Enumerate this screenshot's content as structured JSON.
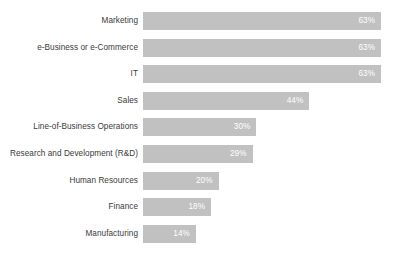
{
  "chart_data": {
    "type": "bar",
    "orientation": "horizontal",
    "title": "",
    "subtitle": "",
    "xlabel": "",
    "ylabel": "",
    "grid": false,
    "legend": false,
    "axis_visible": false,
    "xlim": [
      0,
      67.5
    ],
    "value_suffix": "%",
    "bar_color": "#c1c1c1",
    "value_label_color": "#ffffff",
    "category_label_color": "#3a3a3a",
    "background_color": "#ffffff",
    "categories": [
      "Marketing",
      "e-Business or e-Commerce",
      "IT",
      "Sales",
      "Line-of-Business Operations",
      "Research and Development (R&D)",
      "Human Resources",
      "Finance",
      "Manufacturing"
    ],
    "values": [
      63,
      63,
      63,
      44,
      30,
      29,
      20,
      18,
      14
    ],
    "value_labels": [
      "63%",
      "63%",
      "63%",
      "44%",
      "30%",
      "29%",
      "20%",
      "18%",
      "14%"
    ],
    "bars": [
      {
        "category": "Marketing",
        "value": 63,
        "value_label": "63%"
      },
      {
        "category": "e-Business or e-Commerce",
        "value": 63,
        "value_label": "63%"
      },
      {
        "category": "IT",
        "value": 63,
        "value_label": "63%"
      },
      {
        "category": "Sales",
        "value": 44,
        "value_label": "44%"
      },
      {
        "category": "Line-of-Business Operations",
        "value": 30,
        "value_label": "30%"
      },
      {
        "category": "Research and Development (R&D)",
        "value": 29,
        "value_label": "29%"
      },
      {
        "category": "Human Resources",
        "value": 20,
        "value_label": "20%"
      },
      {
        "category": "Finance",
        "value": 18,
        "value_label": "18%"
      },
      {
        "category": "Manufacturing",
        "value": 14,
        "value_label": "14%"
      }
    ]
  }
}
